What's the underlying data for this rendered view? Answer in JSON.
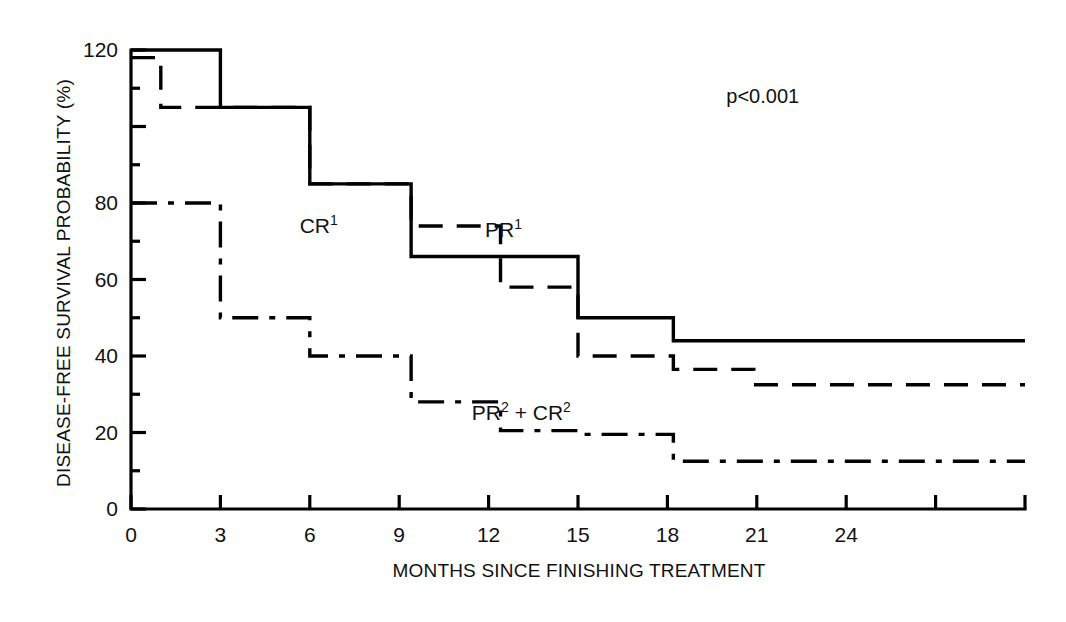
{
  "chart_data": {
    "type": "line",
    "subtype": "kaplan-meier-step",
    "title": "",
    "xlabel": "MONTHS SINCE FINISHING TREATMENT",
    "ylabel": "DISEASE-FREE SURVIVAL PROBABILITY (%)",
    "xlim": [
      0,
      30
    ],
    "ylim": [
      0,
      120
    ],
    "xticks": [
      0,
      3,
      6,
      9,
      12,
      15,
      18,
      21,
      24,
      27,
      30
    ],
    "xtick_labels": [
      "0",
      "3",
      "6",
      "9",
      "12",
      "15",
      "18",
      "21",
      "24",
      "",
      ""
    ],
    "yticks": [
      0,
      10,
      20,
      30,
      40,
      50,
      60,
      70,
      80,
      90,
      100,
      110,
      120
    ],
    "ytick_labels": [
      "0",
      "",
      "20",
      "",
      "40",
      "",
      "60",
      "",
      "80",
      "",
      "",
      "",
      "120"
    ],
    "grid": false,
    "legend_position": "inline-annotations",
    "annotations": [
      {
        "text": "p<0.001",
        "x": 21.2,
        "y": 108
      }
    ],
    "series": [
      {
        "name": "CR1",
        "label": "CR",
        "label_superscript": "1",
        "linestyle": "solid",
        "color": "#000000",
        "label_x": 6.3,
        "label_y": 74,
        "x": [
          0,
          1,
          3,
          6,
          9,
          9.4,
          15,
          18,
          30
        ],
        "y": [
          120,
          120,
          120,
          105,
          85,
          66,
          66,
          50,
          44
        ],
        "steps": [
          {
            "x_start": 0,
            "x_end": 3,
            "y": 120
          },
          {
            "x_start": 3,
            "x_end": 6,
            "y": 105
          },
          {
            "x_start": 6,
            "x_end": 9.4,
            "y": 85
          },
          {
            "x_start": 9.4,
            "x_end": 15,
            "y": 66
          },
          {
            "x_start": 15,
            "x_end": 18.2,
            "y": 50
          },
          {
            "x_start": 18.2,
            "x_end": 30,
            "y": 44
          }
        ]
      },
      {
        "name": "PR1",
        "label": "PR",
        "label_superscript": "1",
        "linestyle": "dashed",
        "color": "#000000",
        "label_x": 12.5,
        "label_y": 73,
        "x": [
          0,
          1,
          3,
          6,
          9.4,
          12,
          15,
          18,
          21,
          30
        ],
        "y": [
          118,
          118,
          105,
          85,
          74,
          58,
          40,
          36.5,
          32.5,
          32.5
        ],
        "steps": [
          {
            "x_start": 0,
            "x_end": 1,
            "y": 118
          },
          {
            "x_start": 1,
            "x_end": 3,
            "y": 105
          },
          {
            "x_start": 3,
            "x_end": 6,
            "y": 105
          },
          {
            "x_start": 6,
            "x_end": 9.4,
            "y": 85
          },
          {
            "x_start": 9.4,
            "x_end": 12.4,
            "y": 74
          },
          {
            "x_start": 12.4,
            "x_end": 15,
            "y": 58
          },
          {
            "x_start": 15,
            "x_end": 18.2,
            "y": 40
          },
          {
            "x_start": 18.2,
            "x_end": 20.9,
            "y": 36.5
          },
          {
            "x_start": 20.9,
            "x_end": 30,
            "y": 32.5
          }
        ]
      },
      {
        "name": "PR2+CR2",
        "label_parts": [
          "PR",
          "2",
          " + CR",
          "2"
        ],
        "linestyle": "dashdot",
        "color": "#000000",
        "label_x": 13.1,
        "label_y": 25,
        "x": [
          0,
          1,
          3,
          6,
          9,
          9.4,
          12,
          15,
          18,
          21,
          30
        ],
        "y": [
          80,
          80,
          80,
          50,
          40,
          28,
          20.5,
          20.5,
          19.5,
          12.5,
          12.5
        ],
        "steps": [
          {
            "x_start": 0,
            "x_end": 3,
            "y": 80
          },
          {
            "x_start": 3,
            "x_end": 6,
            "y": 50
          },
          {
            "x_start": 6,
            "x_end": 9.4,
            "y": 40
          },
          {
            "x_start": 9.4,
            "x_end": 12.4,
            "y": 28
          },
          {
            "x_start": 12.4,
            "x_end": 15.1,
            "y": 20.5
          },
          {
            "x_start": 15.1,
            "x_end": 18.2,
            "y": 19.5
          },
          {
            "x_start": 18.2,
            "x_end": 21,
            "y": 12.5
          },
          {
            "x_start": 21,
            "x_end": 30,
            "y": 12.5
          }
        ]
      }
    ]
  },
  "axes": {
    "y_title": "DISEASE-FREE SURVIVAL PROBABILITY (%)",
    "x_title": "MONTHS SINCE FINISHING TREATMENT"
  },
  "labels": {
    "cr1_text": "CR",
    "cr1_sup": "1",
    "pr1_text": "PR",
    "pr1_sup": "1",
    "pr2cr2_pr": "PR",
    "pr2cr2_pr_sup": "2",
    "pr2cr2_plus": " + CR",
    "pr2cr2_cr_sup": "2",
    "pvalue": "p<0.001"
  },
  "colors": {
    "ink": "#000000",
    "background": "#ffffff"
  }
}
